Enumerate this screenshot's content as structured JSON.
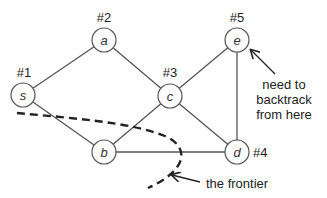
{
  "diagram": {
    "nodes": [
      {
        "id": "s",
        "label": "s",
        "order": "#1",
        "x": 23,
        "y": 95
      },
      {
        "id": "a",
        "label": "a",
        "order": "#2",
        "x": 104,
        "y": 40
      },
      {
        "id": "c",
        "label": "c",
        "order": "#3",
        "x": 170,
        "y": 96
      },
      {
        "id": "d",
        "label": "d",
        "order": "#4",
        "x": 237,
        "y": 152
      },
      {
        "id": "e",
        "label": "e",
        "order": "#5",
        "x": 237,
        "y": 40
      },
      {
        "id": "b",
        "label": "b",
        "order": "",
        "x": 104,
        "y": 152
      }
    ],
    "edges": [
      [
        "s",
        "a"
      ],
      [
        "a",
        "c"
      ],
      [
        "s",
        "b"
      ],
      [
        "c",
        "b"
      ],
      [
        "c",
        "e"
      ],
      [
        "c",
        "d"
      ],
      [
        "e",
        "d"
      ],
      [
        "b",
        "d"
      ]
    ],
    "annotations": {
      "backtrack_line1": "need to",
      "backtrack_line2": "backtrack",
      "backtrack_line3": "from here",
      "frontier": "the frontier"
    }
  }
}
